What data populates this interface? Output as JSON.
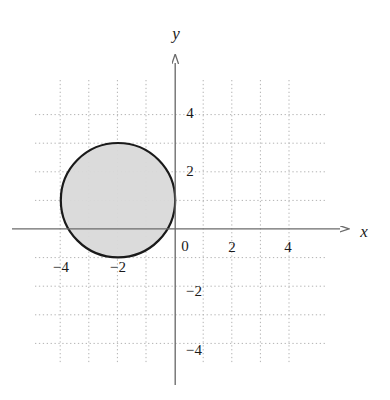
{
  "chart_data": {
    "type": "scatter",
    "title": "",
    "xlabel": "x",
    "ylabel": "y",
    "xlim": [
      -5.5,
      6.0
    ],
    "ylim": [
      -5.5,
      5.5
    ],
    "grid": true,
    "grid_spacing": 1,
    "legend": "none",
    "x_ticks": [
      -4,
      -2,
      2,
      4
    ],
    "x_tick_labels": [
      "−4",
      "−2",
      "2",
      "4"
    ],
    "y_ticks": [
      4,
      2,
      -2,
      -4
    ],
    "y_tick_labels": [
      "4",
      "2",
      "−2",
      "−4"
    ],
    "origin_label": "0",
    "shapes": [
      {
        "kind": "circle",
        "equation": "(x + 2)^2 + (y - 1)^2 = 4",
        "center_x": -2,
        "center_y": 1,
        "radius": 2,
        "fill": "#d9d9d9",
        "stroke": "#1a1a1a",
        "stroke_width": 2.2,
        "filled": true
      }
    ],
    "axes": {
      "x_axis_arrow": true,
      "y_axis_arrow": true,
      "x_axis_color": "#6b6b6b",
      "y_axis_color": "#6b6b6b"
    }
  },
  "colors": {
    "background": "#ffffff",
    "grid": "#b9b9b9",
    "axis": "#6b6b6b",
    "shape_fill": "#d9d9d9",
    "shape_stroke": "#1a1a1a",
    "text": "#1a1a1a"
  },
  "labels": {
    "x_axis": "x",
    "y_axis": "y",
    "origin": "0",
    "x_neg4": "−4",
    "x_neg2": "−2",
    "x_pos2": "2",
    "x_pos4": "4",
    "y_pos4": "4",
    "y_pos2": "2",
    "y_neg2": "−2",
    "y_neg4": "−4"
  }
}
